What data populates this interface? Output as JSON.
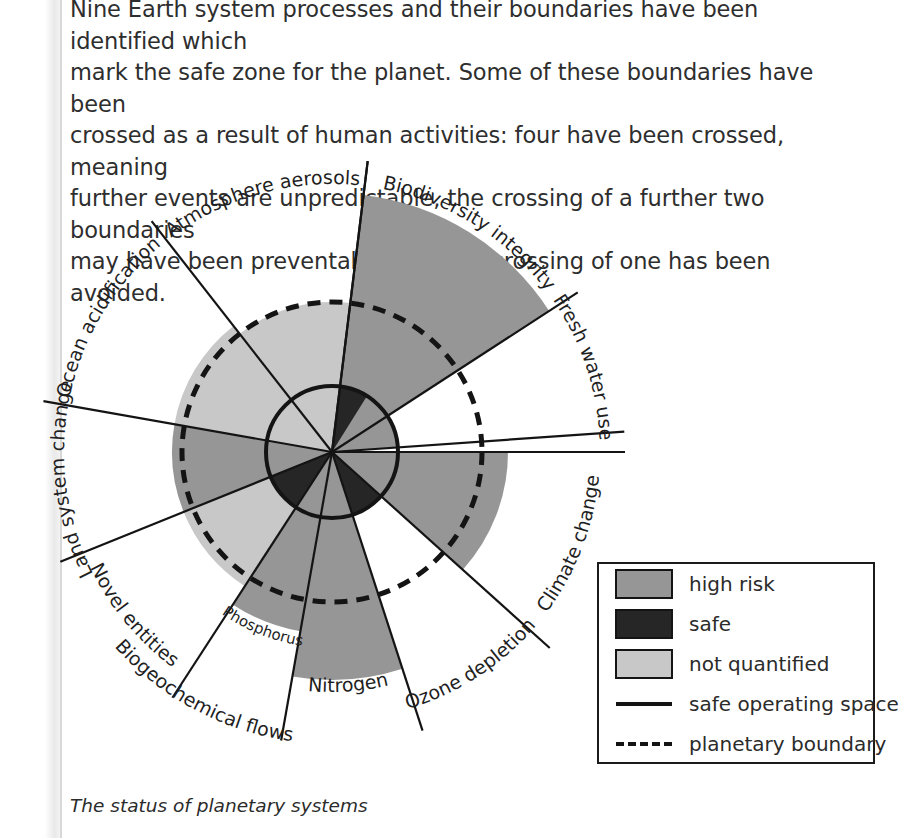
{
  "body_copy": {
    "lines": [
      "Nine Earth system processes and their boundaries have been identified which",
      "mark the safe zone for the planet. Some of these boundaries have been",
      "crossed as a result of human activities: four have been crossed, meaning",
      "further events are unpredictable, the crossing of a further two boundaries",
      "may have been preventable, and the crossing of one has been avoided."
    ]
  },
  "caption": "The status of planetary systems",
  "colors": {
    "high_risk": "#969696",
    "safe": "#262626",
    "not_quantified": "#c8c8c8",
    "ink": "#141414",
    "page": "#ffffff"
  },
  "legend": {
    "items": [
      {
        "label": "high risk",
        "type": "swatch",
        "color": "#969696"
      },
      {
        "label": "safe",
        "type": "swatch",
        "color": "#262626"
      },
      {
        "label": "not quantified",
        "type": "swatch",
        "color": "#c8c8c8"
      },
      {
        "label": "safe operating space",
        "type": "solid-line"
      },
      {
        "label": "planetary boundary",
        "type": "dashed-line"
      }
    ]
  },
  "chart_data": {
    "type": "pie",
    "title": "The status of planetary systems",
    "subtype": "planetary-boundaries-radial-wedge-diagram",
    "center": {
      "x": 332,
      "y": 302
    },
    "radii": {
      "safe_operating_space": 66,
      "planetary_boundary": 150,
      "spoke": 293
    },
    "rings": [
      {
        "name": "safe operating space",
        "radius": 66,
        "style": "solid",
        "stroke": "#141414",
        "width": 4
      },
      {
        "name": "planetary boundary",
        "radius": 150,
        "style": "dashed",
        "stroke": "#141414",
        "width": 5
      }
    ],
    "categories": [
      "Biodiversity integrity",
      "Fresh water use",
      "Climate change",
      "Ozone depletion",
      "Nitrogen",
      "Phosphorus",
      "Novel entities",
      "Land system change",
      "Ocean acidification",
      "Atmosphere aerosols"
    ],
    "sectors": [
      {
        "label": "Biodiversity integrity",
        "status": "high risk",
        "start_deg": -83,
        "end_deg": -33,
        "outer_radius": 259,
        "inner_high_radius": 259,
        "label_radius": 268,
        "flip": false
      },
      {
        "label": "Fresh water use",
        "status": "high risk",
        "start_deg": -33,
        "end_deg": -4,
        "outer_radius": 66,
        "inner_high_radius": 66,
        "label_radius": 268,
        "flip": false
      },
      {
        "label": "Climate change",
        "status": "high risk",
        "start_deg": 0,
        "end_deg": 42,
        "outer_radius": 176,
        "inner_high_radius": 176,
        "label_radius": 268,
        "flip": true
      },
      {
        "label": "Ozone depletion",
        "status": "safe",
        "start_deg": 42,
        "end_deg": 72,
        "outer_radius": 66,
        "inner_high_radius": 66,
        "label_radius": 268,
        "flip": true
      },
      {
        "label": "Nitrogen",
        "status": "high risk",
        "start_deg": 72,
        "end_deg": 100,
        "outer_radius": 228,
        "inner_high_radius": 228,
        "label_radius": 240,
        "flip": true
      },
      {
        "label": "Phosphorus",
        "status": "high risk",
        "start_deg": 100,
        "end_deg": 123,
        "outer_radius": 182,
        "inner_high_radius": 182,
        "label_radius": 196,
        "flip": true
      },
      {
        "label": "Novel entities",
        "status": "not quantified",
        "start_deg": 123,
        "end_deg": 158,
        "outer_radius": 160,
        "inner_high_radius": 160,
        "label_radius": 268,
        "flip": true
      },
      {
        "label": "Land system change",
        "status": "high risk",
        "start_deg": 158,
        "end_deg": 190,
        "outer_radius": 160,
        "inner_high_radius": 160,
        "label_radius": 268,
        "flip": false
      },
      {
        "label": "Ocean acidification",
        "status": "not quantified",
        "start_deg": 190,
        "end_deg": 232,
        "outer_radius": 160,
        "inner_high_radius": 160,
        "label_radius": 268,
        "flip": false
      },
      {
        "label": "Atmosphere aerosols",
        "status": "not quantified",
        "start_deg": 232,
        "end_deg": 277,
        "outer_radius": 150,
        "inner_high_radius": 150,
        "label_radius": 268,
        "flip": false
      }
    ],
    "legend_entries": [
      "high risk",
      "safe",
      "not quantified",
      "safe operating space",
      "planetary boundary"
    ],
    "legend_position": "bottom-right",
    "grid": false
  }
}
